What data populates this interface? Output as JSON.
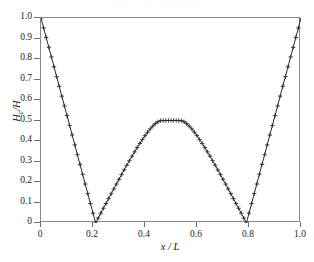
{
  "figure": {
    "top_caption": "··· ·· ··· ·· · ···· ············",
    "background_color": "#ffffff",
    "frame_color": "#8a8a8e",
    "curve_color": "#2b2b2b"
  },
  "chart_data": {
    "type": "line",
    "title": "",
    "xlabel": "x / L",
    "ylabel": "Hₑ/H",
    "ylabel_base": "H",
    "ylabel_sub": "c",
    "ylabel_tail": "/H",
    "xlim": [
      0,
      1.0
    ],
    "ylim": [
      0,
      1.0
    ],
    "grid": false,
    "legend": null,
    "marker": "plus",
    "marker_symbol": "+",
    "line_style": "solid",
    "xticks": [
      0,
      0.2,
      0.4,
      0.6,
      0.8,
      1.0
    ],
    "xtick_labels": [
      "0",
      "0.2",
      "0.4",
      "0.6",
      "0.8",
      "1.0"
    ],
    "yticks": [
      0,
      0.1,
      0.2,
      0.3,
      0.4,
      0.5,
      0.6,
      0.7,
      0.8,
      0.9,
      1.0
    ],
    "ytick_labels": [
      "0",
      "0.1",
      "0.2",
      "0.3",
      "0.4",
      "0.5",
      "0.6",
      "0.7",
      "0.8",
      "0.9",
      "1.0"
    ],
    "zero_crossings": [
      0.21,
      0.79
    ],
    "peak": {
      "x": 0.5,
      "y": 0.5
    },
    "endpoints": [
      {
        "x": 0.0,
        "y": 1.0
      },
      {
        "x": 1.0,
        "y": 1.0
      }
    ],
    "x": [
      0.0,
      0.01,
      0.02,
      0.03,
      0.04,
      0.05,
      0.06,
      0.07,
      0.08,
      0.09,
      0.1,
      0.11,
      0.12,
      0.13,
      0.14,
      0.15,
      0.16,
      0.17,
      0.18,
      0.19,
      0.2,
      0.21,
      0.22,
      0.23,
      0.24,
      0.25,
      0.26,
      0.27,
      0.28,
      0.29,
      0.3,
      0.31,
      0.32,
      0.33,
      0.34,
      0.35,
      0.36,
      0.37,
      0.38,
      0.39,
      0.4,
      0.41,
      0.42,
      0.43,
      0.44,
      0.45,
      0.46,
      0.47,
      0.48,
      0.49,
      0.5,
      0.51,
      0.52,
      0.53,
      0.54,
      0.55,
      0.56,
      0.57,
      0.58,
      0.59,
      0.6,
      0.61,
      0.62,
      0.63,
      0.64,
      0.65,
      0.66,
      0.67,
      0.68,
      0.69,
      0.7,
      0.71,
      0.72,
      0.73,
      0.74,
      0.75,
      0.76,
      0.77,
      0.78,
      0.79,
      0.8,
      0.81,
      0.82,
      0.83,
      0.84,
      0.85,
      0.86,
      0.87,
      0.88,
      0.89,
      0.9,
      0.91,
      0.92,
      0.93,
      0.94,
      0.95,
      0.96,
      0.97,
      0.98,
      0.99,
      1.0
    ],
    "y": [
      1.0,
      0.952,
      0.905,
      0.857,
      0.81,
      0.762,
      0.714,
      0.667,
      0.619,
      0.571,
      0.524,
      0.476,
      0.429,
      0.381,
      0.333,
      0.286,
      0.238,
      0.19,
      0.143,
      0.095,
      0.048,
      0.0,
      0.024,
      0.048,
      0.072,
      0.095,
      0.119,
      0.143,
      0.166,
      0.19,
      0.213,
      0.236,
      0.259,
      0.282,
      0.304,
      0.326,
      0.347,
      0.368,
      0.388,
      0.407,
      0.426,
      0.443,
      0.459,
      0.473,
      0.485,
      0.494,
      0.499,
      0.5,
      0.5,
      0.5,
      0.5,
      0.5,
      0.5,
      0.5,
      0.499,
      0.494,
      0.485,
      0.473,
      0.459,
      0.443,
      0.426,
      0.407,
      0.388,
      0.368,
      0.347,
      0.326,
      0.304,
      0.282,
      0.259,
      0.236,
      0.213,
      0.19,
      0.166,
      0.143,
      0.119,
      0.095,
      0.072,
      0.048,
      0.024,
      0.0,
      0.048,
      0.095,
      0.143,
      0.19,
      0.238,
      0.286,
      0.333,
      0.381,
      0.429,
      0.476,
      0.524,
      0.571,
      0.619,
      0.667,
      0.714,
      0.762,
      0.81,
      0.857,
      0.905,
      0.952,
      1.0
    ]
  }
}
